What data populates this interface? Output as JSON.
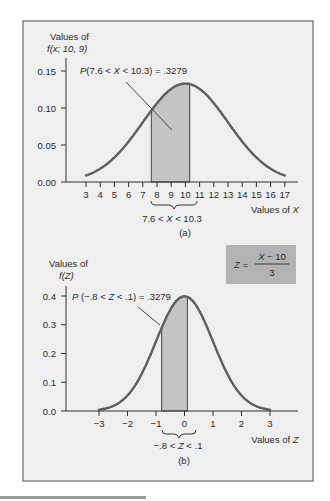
{
  "chart_data": [
    {
      "type": "line",
      "panel_label": "(a)",
      "title": "",
      "distribution": "normal",
      "mean": 10,
      "variance": 9,
      "std_dev": 3,
      "ylabel_line1": "Values of",
      "ylabel_line2": "f(x; 10, 9)",
      "xlabel": "Values of X",
      "x_ticks": [
        3,
        4,
        5,
        6,
        7,
        8,
        9,
        10,
        11,
        12,
        13,
        14,
        15,
        16,
        17
      ],
      "y_ticks": [
        "0.00",
        "0.05",
        "0.10",
        "0.15"
      ],
      "xlim": [
        3,
        17
      ],
      "ylim": [
        0,
        0.15
      ],
      "grid": false,
      "shaded_region": {
        "from": 7.6,
        "to": 10.3
      },
      "annotation": "P(7.6 < X < 10.3) = .3279",
      "bracket_label": "7.6 < X < 10.3",
      "probability": 0.3279
    },
    {
      "type": "line",
      "panel_label": "(b)",
      "title": "",
      "distribution": "standard normal",
      "mean": 0,
      "std_dev": 1,
      "ylabel_line1": "Values of",
      "ylabel_line2": "f(Z)",
      "xlabel": "Values of Z",
      "x_ticks": [
        "−3",
        "−2",
        "−1",
        "0",
        "1",
        "2",
        "3"
      ],
      "y_ticks": [
        "0.0",
        "0.1",
        "0.2",
        "0.3",
        "0.4"
      ],
      "xlim": [
        -3,
        3
      ],
      "ylim": [
        0,
        0.4
      ],
      "grid": false,
      "shaded_region": {
        "from": -0.8,
        "to": 0.1
      },
      "annotation": "P (−.8 < Z < .1) = .3279",
      "bracket_label": "−.8 < Z < .1",
      "probability": 0.3279,
      "formula_box": {
        "lhs": "Z =",
        "numerator": "X − 10",
        "denominator": "3"
      }
    }
  ],
  "colors": {
    "background": "#efefef",
    "curve": "#5e5e5e",
    "shade": "#c4c4c4",
    "formula_box": "#b3b3b3",
    "axis": "#333333"
  }
}
